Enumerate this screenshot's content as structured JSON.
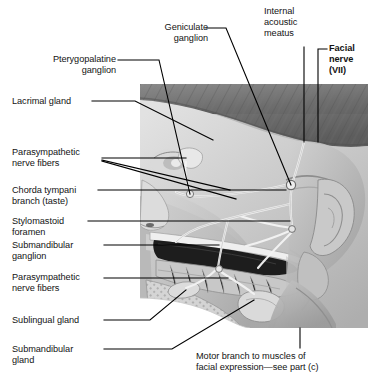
{
  "figure": {
    "type": "anatomical-illustration",
    "style": "grayscale half-tone medical illustration",
    "image_region": {
      "x": 140,
      "y": 84,
      "width": 228,
      "height": 244
    }
  },
  "labels": {
    "geniculate_ganglion": {
      "text": "Geniculate\nganglion",
      "align": "right"
    },
    "internal_acoustic_meatus": {
      "text": "Internal\nacoustic\nmeatus",
      "align": "left"
    },
    "facial_nerve": {
      "text": "Facial\nnerve\n(VII)",
      "align": "left",
      "bold": true
    },
    "pterygopalatine_ganglion": {
      "text": "Pterygopalatine\nganglion",
      "align": "right"
    },
    "lacrimal_gland": {
      "text": "Lacrimal gland",
      "align": "left"
    },
    "parasympathetic_nerve_fibers_upper": {
      "text": "Parasympathetic\nnerve fibers",
      "align": "left"
    },
    "chorda_tympani_branch": {
      "text": "Chorda tympani\nbranch (taste)",
      "align": "left"
    },
    "stylomastoid_foramen": {
      "text": "Stylomastoid\nforamen",
      "align": "left"
    },
    "submandibular_ganglion": {
      "text": "Submandibular\nganglion",
      "align": "left"
    },
    "parasympathetic_nerve_fibers_lower": {
      "text": "Parasympathetic\nnerve fibers",
      "align": "left"
    },
    "sublingual_gland": {
      "text": "Sublingual gland",
      "align": "left"
    },
    "submandibular_gland": {
      "text": "Submandibular\ngland",
      "align": "left"
    },
    "motor_branch_caption": {
      "text": "Motor branch to muscles of\nfacial expression—see part (c)",
      "align": "left"
    }
  },
  "colors": {
    "text": "#131313",
    "leader_line": "#000000",
    "background": "#ffffff",
    "hair_dark": "#6b6b6b",
    "skin_light": "#cfcfcf",
    "oral_cavity_dark": "#1a1a1a",
    "nerve_highlight": "#f2f2f2"
  }
}
